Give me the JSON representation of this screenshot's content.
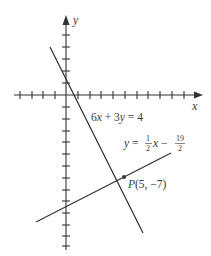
{
  "figure": {
    "axes": {
      "x_label": "x",
      "y_label": "y",
      "origin_px": [
        66,
        95
      ],
      "unit_px": 11.7,
      "x_ticks_left": 4,
      "x_ticks_right": 11,
      "y_ticks_up": 5,
      "y_ticks_down": 13
    },
    "lines": [
      {
        "name": "line-1",
        "equation": "6x + 3y = 4",
        "label_parts": {
          "a": "6",
          "x": "x",
          "plus": " + 3",
          "y": "y",
          "rhs": " = 4"
        },
        "color": "#333333"
      },
      {
        "name": "line-2",
        "equation": "y = (1/2)x - 19/2",
        "label_parts": {
          "lhs": "y",
          "eq": " = ",
          "num1": "1",
          "den1": "2",
          "x": "x",
          "minus": " − ",
          "num2": "19",
          "den2": "2"
        },
        "color": "#333333"
      }
    ],
    "point": {
      "letter": "P",
      "coords": "(5, −7)",
      "x": 5,
      "y": -7,
      "color": "#333333"
    },
    "colors": {
      "ink": "#333333",
      "text": "#3a3a3a",
      "background": "#ffffff"
    }
  }
}
